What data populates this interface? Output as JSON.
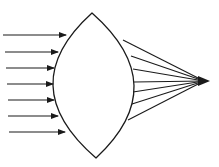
{
  "diagram": {
    "stroke_color": "#1a1a1a",
    "background": "#ffffff",
    "lens": {
      "top": [
        92,
        13
      ],
      "bottom": [
        96,
        158
      ],
      "left_extreme_x": 53,
      "right_extreme_x": 134
    },
    "incoming_rays": [
      {
        "y": 35,
        "x_start": 3,
        "x_end": 66
      },
      {
        "y": 52,
        "x_start": 5,
        "x_end": 58
      },
      {
        "y": 68,
        "x_start": 6,
        "x_end": 54
      },
      {
        "y": 84,
        "x_start": 7,
        "x_end": 53
      },
      {
        "y": 100,
        "x_start": 8,
        "x_end": 54
      },
      {
        "y": 116,
        "x_start": 8,
        "x_end": 58
      },
      {
        "y": 132,
        "x_start": 9,
        "x_end": 65
      }
    ],
    "outgoing_rays": [
      {
        "x": 123,
        "y": 40
      },
      {
        "x": 131,
        "y": 56
      },
      {
        "x": 133,
        "y": 69
      },
      {
        "x": 134,
        "y": 82
      },
      {
        "x": 133,
        "y": 92
      },
      {
        "x": 132,
        "y": 104
      },
      {
        "x": 128,
        "y": 120
      }
    ],
    "focal_point": [
      208,
      81
    ]
  }
}
